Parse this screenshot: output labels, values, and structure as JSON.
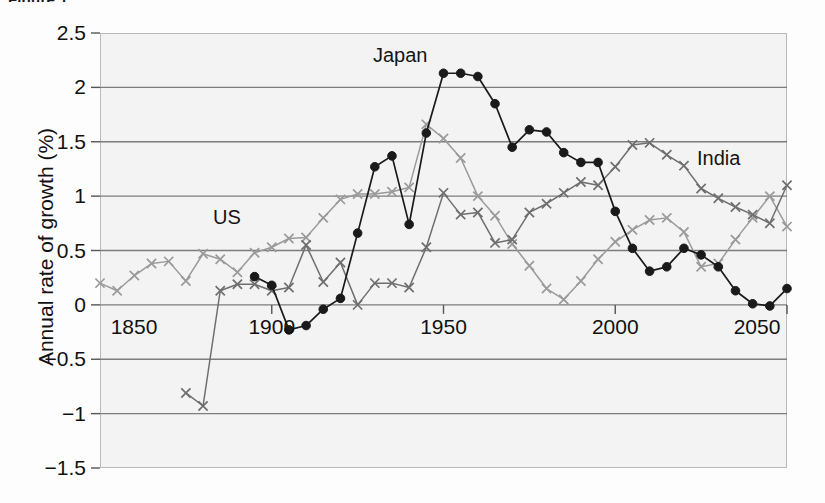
{
  "figure": {
    "caption_sliver": "Figure 1",
    "axis_title_y": "Annual rate of growth (%)",
    "ylabels": [
      "2.5",
      "2",
      "1.5",
      "1",
      "0.5",
      "0",
      "−0.5",
      "−1",
      "−1.5"
    ],
    "xlabels": [
      "1850",
      "1900",
      "1950",
      "2000",
      "2050"
    ],
    "series_labels": {
      "us": "US",
      "japan": "Japan",
      "india": "India"
    },
    "colors": {
      "us": "#9a9a9a",
      "india": "#6e6e6e",
      "japan": "#1a1a1a",
      "gridline": "#7d7d7d",
      "frame": "#b9b9b9",
      "plot_background": "#f3f3f3"
    }
  },
  "chart_data": {
    "type": "line",
    "title": "",
    "xlabel": "",
    "ylabel": "Annual rate of growth (%)",
    "xlim": [
      1850,
      2050
    ],
    "ylim": [
      -1.5,
      2.5
    ],
    "ytick_values": [
      2.5,
      2,
      1.5,
      1,
      0.5,
      0,
      -0.5,
      -1,
      -1.5
    ],
    "xtick_values": [
      1850,
      1900,
      1950,
      2000,
      2050
    ],
    "grid": true,
    "legend": "inline-annotations",
    "series": [
      {
        "name": "US",
        "marker": "x",
        "color": "#9a9a9a",
        "x": [
          1850,
          1855,
          1860,
          1865,
          1870,
          1875,
          1880,
          1885,
          1890,
          1895,
          1900,
          1905,
          1910,
          1915,
          1920,
          1925,
          1930,
          1935,
          1940,
          1945,
          1950,
          1955,
          1960,
          1965,
          1970,
          1975,
          1980,
          1985,
          1990,
          1995,
          2000,
          2005,
          2010,
          2015,
          2020,
          2025,
          2030,
          2035,
          2040,
          2045,
          2050
        ],
        "y": [
          0.2,
          0.13,
          0.27,
          0.38,
          0.4,
          0.22,
          0.47,
          0.42,
          0.3,
          0.48,
          0.53,
          0.61,
          0.62,
          0.8,
          0.97,
          1.02,
          1.02,
          1.04,
          1.08,
          1.66,
          1.53,
          1.35,
          1.0,
          0.82,
          0.56,
          0.36,
          0.15,
          0.05,
          0.22,
          0.42,
          0.58,
          0.69,
          0.78,
          0.8,
          0.67,
          0.35,
          0.38,
          0.6,
          0.8,
          1.0,
          0.72
        ]
      },
      {
        "name": "India",
        "marker": "x",
        "color": "#6e6e6e",
        "x": [
          1875,
          1880,
          1885,
          1890,
          1895,
          1900,
          1905,
          1910,
          1915,
          1920,
          1925,
          1930,
          1935,
          1940,
          1945,
          1950,
          1955,
          1960,
          1965,
          1970,
          1975,
          1980,
          1985,
          1990,
          1995,
          2000,
          2005,
          2010,
          2015,
          2020,
          2025,
          2030,
          2035,
          2040,
          2045,
          2050
        ],
        "y": [
          -0.81,
          -0.93,
          0.13,
          0.19,
          0.19,
          0.13,
          0.16,
          0.55,
          0.21,
          0.39,
          0.0,
          0.2,
          0.2,
          0.16,
          0.53,
          1.03,
          0.83,
          0.85,
          0.57,
          0.6,
          0.85,
          0.93,
          1.03,
          1.13,
          1.1,
          1.27,
          1.47,
          1.49,
          1.38,
          1.28,
          1.07,
          0.98,
          0.9,
          0.83,
          0.75,
          1.1
        ]
      },
      {
        "name": "Japan",
        "marker": "o",
        "color": "#1a1a1a",
        "x": [
          1895,
          1900,
          1905,
          1910,
          1915,
          1920,
          1925,
          1930,
          1935,
          1940,
          1945,
          1950,
          1955,
          1960,
          1965,
          1970,
          1975,
          1980,
          1985,
          1990,
          1995,
          2000,
          2005,
          2010,
          2015,
          2020,
          2025,
          2030,
          2035,
          2040,
          2045,
          2050
        ],
        "y": [
          0.26,
          0.18,
          -0.23,
          -0.19,
          -0.04,
          0.06,
          0.66,
          1.27,
          1.37,
          0.74,
          1.58,
          2.13,
          2.13,
          2.1,
          1.85,
          1.45,
          1.61,
          1.59,
          1.4,
          1.31,
          1.31,
          0.86,
          0.52,
          0.31,
          0.35,
          0.52,
          0.46,
          0.35,
          0.13,
          0.01,
          -0.01,
          0.15
        ]
      }
    ]
  }
}
